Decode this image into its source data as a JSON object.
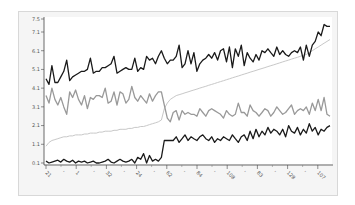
{
  "chart_data": {
    "type": "line",
    "title": "",
    "xlabel": "",
    "ylabel": "",
    "ylim": [
      0.1,
      7.5
    ],
    "grid": false,
    "legend": null,
    "y_ticks": [
      "0.1",
      "1.1",
      "2.1",
      "3.1",
      "4.1",
      "5.1",
      "6.1",
      "7.1",
      "7.5"
    ],
    "y_tick_values": [
      0.1,
      1.1,
      2.1,
      3.1,
      4.1,
      5.1,
      6.1,
      7.1,
      7.5
    ],
    "x_tick_labels": [
      "21",
      "1",
      "32",
      "24",
      "62",
      "84",
      "108",
      "83",
      "128",
      "107"
    ],
    "n_points": 96,
    "series": [
      {
        "name": "top-dark",
        "color": "#1a1a1a",
        "width": 1.3,
        "values": [
          4.6,
          4.3,
          5.3,
          4.4,
          4.4,
          4.7,
          5.0,
          5.6,
          4.5,
          4.7,
          4.8,
          4.9,
          5.0,
          5.0,
          5.1,
          5.7,
          4.9,
          5.0,
          5.0,
          5.2,
          5.2,
          5.3,
          5.4,
          5.8,
          4.9,
          5.0,
          5.1,
          5.2,
          5.1,
          5.1,
          5.7,
          5.0,
          5.2,
          5.1,
          5.8,
          5.6,
          5.7,
          5.4,
          5.8,
          6.1,
          5.7,
          5.4,
          5.6,
          5.6,
          5.8,
          6.4,
          5.2,
          5.4,
          6.1,
          5.4,
          6.0,
          5.0,
          5.4,
          5.6,
          5.7,
          5.9,
          5.7,
          6.0,
          5.6,
          6.1,
          6.2,
          5.5,
          6.3,
          5.2,
          6.2,
          5.8,
          6.4,
          5.3,
          6.0,
          5.7,
          5.5,
          5.9,
          5.6,
          6.1,
          6.0,
          6.2,
          6.0,
          5.8,
          6.3,
          5.9,
          6.1,
          5.9,
          5.8,
          6.0,
          6.1,
          6.0,
          6.3,
          5.6,
          6.4,
          5.8,
          6.4,
          6.6,
          7.1,
          6.9,
          7.5,
          7.4,
          7.4
        ]
      },
      {
        "name": "mid-gray",
        "color": "#999999",
        "width": 1.3,
        "values": [
          3.7,
          3.3,
          4.1,
          3.5,
          3.2,
          3.6,
          3.1,
          2.7,
          3.9,
          3.6,
          4.0,
          3.5,
          3.2,
          3.7,
          3.0,
          3.6,
          3.5,
          3.7,
          3.7,
          3.6,
          4.1,
          3.3,
          3.4,
          3.9,
          3.2,
          3.9,
          3.8,
          3.3,
          3.5,
          4.2,
          3.6,
          3.4,
          3.7,
          3.5,
          3.3,
          3.8,
          3.4,
          3.7,
          3.9,
          3.9,
          3.2,
          2.5,
          2.3,
          2.8,
          2.9,
          2.4,
          2.9,
          2.7,
          2.8,
          2.7,
          2.7,
          2.6,
          3.0,
          2.8,
          2.6,
          2.9,
          3.0,
          2.9,
          2.8,
          2.7,
          2.5,
          2.9,
          2.7,
          2.6,
          2.7,
          3.3,
          2.8,
          2.8,
          2.6,
          3.2,
          2.9,
          2.8,
          2.6,
          2.8,
          3.0,
          2.9,
          2.6,
          2.8,
          3.1,
          2.9,
          2.7,
          2.8,
          3.0,
          3.2,
          2.7,
          2.9,
          3.0,
          2.9,
          3.1,
          2.7,
          3.3,
          2.9,
          3.5,
          2.9,
          3.6,
          2.7,
          2.6
        ]
      },
      {
        "name": "light-gray-smooth",
        "color": "#c8c8c8",
        "width": 1.0,
        "values": [
          1.0,
          1.2,
          1.3,
          1.35,
          1.4,
          1.45,
          1.5,
          1.5,
          1.55,
          1.55,
          1.6,
          1.6,
          1.6,
          1.65,
          1.65,
          1.7,
          1.7,
          1.7,
          1.75,
          1.75,
          1.8,
          1.8,
          1.8,
          1.85,
          1.85,
          1.9,
          1.9,
          1.9,
          1.95,
          1.95,
          2.0,
          2.0,
          2.05,
          2.05,
          2.1,
          2.15,
          2.2,
          2.25,
          2.3,
          2.4,
          3.0,
          3.3,
          3.5,
          3.6,
          3.7,
          3.75,
          3.8,
          3.85,
          3.9,
          3.95,
          4.0,
          4.05,
          4.1,
          4.15,
          4.2,
          4.25,
          4.3,
          4.35,
          4.4,
          4.45,
          4.5,
          4.55,
          4.6,
          4.65,
          4.7,
          4.75,
          4.8,
          4.85,
          4.9,
          4.95,
          5.0,
          5.05,
          5.1,
          5.15,
          5.2,
          5.25,
          5.3,
          5.35,
          5.4,
          5.45,
          5.5,
          5.55,
          5.6,
          5.65,
          5.7,
          5.75,
          5.8,
          5.85,
          5.9,
          6.0,
          6.1,
          6.2,
          6.3,
          6.4,
          6.5,
          6.6,
          6.7
        ]
      },
      {
        "name": "bottom-dark",
        "color": "#1a1a1a",
        "width": 1.3,
        "values": [
          0.2,
          0.1,
          0.15,
          0.2,
          0.25,
          0.15,
          0.3,
          0.2,
          0.15,
          0.25,
          0.1,
          0.2,
          0.15,
          0.2,
          0.1,
          0.15,
          0.2,
          0.1,
          0.1,
          0.15,
          0.2,
          0.3,
          0.15,
          0.1,
          0.2,
          0.3,
          0.2,
          0.15,
          0.2,
          0.3,
          0.1,
          0.4,
          0.3,
          0.6,
          0.1,
          0.5,
          0.2,
          0.3,
          0.2,
          0.4,
          1.3,
          1.3,
          1.3,
          1.3,
          1.5,
          1.2,
          1.4,
          1.6,
          1.3,
          1.5,
          1.4,
          1.3,
          1.5,
          1.6,
          1.4,
          1.3,
          1.5,
          1.2,
          1.4,
          1.3,
          1.5,
          1.4,
          1.3,
          1.6,
          1.4,
          1.2,
          1.5,
          1.6,
          1.3,
          1.8,
          1.4,
          1.9,
          1.5,
          1.8,
          1.6,
          2.0,
          1.7,
          1.9,
          1.8,
          1.6,
          1.9,
          1.5,
          2.1,
          1.8,
          1.7,
          2.0,
          1.6,
          1.9,
          1.7,
          2.2,
          1.8,
          2.0,
          1.6,
          1.9,
          1.8,
          2.0,
          2.1
        ]
      }
    ]
  }
}
